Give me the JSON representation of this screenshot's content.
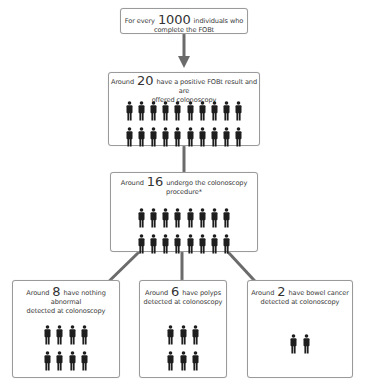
{
  "title_box": {
    "prefix": "For every",
    "number": "1000",
    "suffix": "individuals who complete the FOBt"
  },
  "step1": {
    "prefix": "Around",
    "number": "20",
    "line1": "have a positive FOBt result and are",
    "line2": "offered colonoscopy",
    "people_rows": [
      10,
      10
    ]
  },
  "step2": {
    "prefix": "Around",
    "number": "16",
    "line1": "undergo the colonoscopy",
    "line2": "procedure*",
    "people_rows": [
      8,
      8
    ]
  },
  "outcomes": [
    {
      "prefix": "Around",
      "number": "8",
      "line1": "have nothing abnormal",
      "line2": "detected at colonoscopy",
      "people_rows": [
        4,
        4
      ]
    },
    {
      "prefix": "Around",
      "number": "6",
      "line1": "have polyps",
      "line2": "detected at colonoscopy",
      "people_rows": [
        3,
        3
      ]
    },
    {
      "prefix": "Around",
      "number": "2",
      "line1": "have bowel cancer",
      "line2": "detected at colonoscopy",
      "people_rows": [
        2
      ]
    }
  ],
  "colors": {
    "arrow": "#6b6b6b",
    "person": "#1e1e1e",
    "border": "#9a9a9a"
  }
}
